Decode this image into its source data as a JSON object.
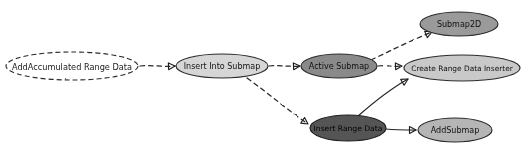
{
  "diagram": {
    "type": "call-graph",
    "style": "hand-drawn sketch",
    "background_color": "#ffffff",
    "nodes": [
      {
        "id": "add_accumulated_range_data",
        "label": "AddAccumulated Range Data",
        "cx": 72,
        "cy": 66,
        "rx": 66,
        "ry": 14,
        "fill": "#ffffff",
        "stroke": "#2b2b2b",
        "stroke_dasharray": "5,3",
        "text_color": "#1a1a1a",
        "font_size": 8.2
      },
      {
        "id": "insert_into_submap",
        "label": "Insert Into Submap",
        "cx": 222,
        "cy": 66,
        "rx": 46,
        "ry": 12,
        "fill": "#d6d6d6",
        "stroke": "#2b2b2b",
        "stroke_dasharray": "none",
        "text_color": "#141414",
        "font_size": 8.0
      },
      {
        "id": "active_submap",
        "label": "Active Submap",
        "cx": 339,
        "cy": 66,
        "rx": 38,
        "ry": 12,
        "fill": "#8a8a8a",
        "stroke": "#2b2b2b",
        "stroke_dasharray": "none",
        "text_color": "#101010",
        "font_size": 8.0
      },
      {
        "id": "submap_2d",
        "label": "Submap2D",
        "cx": 459,
        "cy": 24,
        "rx": 39,
        "ry": 12,
        "fill": "#9a9a9a",
        "stroke": "#2b2b2b",
        "stroke_dasharray": "none",
        "text_color": "#101010",
        "font_size": 8.0
      },
      {
        "id": "create_range_data_inserter",
        "label": "Create Range Data Inserter",
        "cx": 462,
        "cy": 68,
        "rx": 58,
        "ry": 13,
        "fill": "#c9c9c9",
        "stroke": "#2b2b2b",
        "stroke_dasharray": "none",
        "text_color": "#101010",
        "font_size": 7.4
      },
      {
        "id": "insert_range_data",
        "label": "Insert Range Data",
        "cx": 348,
        "cy": 128,
        "rx": 38,
        "ry": 13,
        "fill": "#555555",
        "stroke": "#1f1f1f",
        "stroke_dasharray": "none",
        "text_color": "#000000",
        "font_size": 7.6
      },
      {
        "id": "add_submap",
        "label": "AddSubmap",
        "cx": 455,
        "cy": 130,
        "rx": 37,
        "ry": 12,
        "fill": "#b5b5b5",
        "stroke": "#2b2b2b",
        "stroke_dasharray": "none",
        "text_color": "#101010",
        "font_size": 8.0
      }
    ],
    "edges": [
      {
        "id": "edge-add-accumulated-to-insert-into-submap",
        "from": "add_accumulated_range_data",
        "to": "insert_into_submap",
        "style": "dashed",
        "path": "M 140 66 C 152 65, 162 67, 175 66",
        "arrow": true
      },
      {
        "id": "edge-insert-into-submap-to-active-submap",
        "from": "insert_into_submap",
        "to": "active_submap",
        "style": "dashed",
        "path": "M 269 66 C 280 65, 289 67, 300 66",
        "arrow": true
      },
      {
        "id": "edge-insert-into-submap-to-insert-range-data",
        "from": "insert_into_submap",
        "to": "insert_range_data",
        "style": "dashed",
        "path": "M 247 78 C 272 96, 290 112, 308 124",
        "arrow": true
      },
      {
        "id": "edge-active-submap-to-submap2d",
        "from": "active_submap",
        "to": "submap_2d",
        "style": "dashed",
        "path": "M 371 60 C 392 50, 412 40, 432 32",
        "arrow": true
      },
      {
        "id": "edge-active-submap-to-create-range-data-inserter",
        "from": "active_submap",
        "to": "create_range_data_inserter",
        "style": "dashed",
        "path": "M 378 66 C 386 65, 394 67, 402 66",
        "arrow": true
      },
      {
        "id": "edge-insert-range-data-to-create-range-data-inserter",
        "from": "insert_range_data",
        "to": "create_range_data_inserter",
        "style": "solid",
        "path": "M 358 116 C 374 102, 392 88, 408 79",
        "arrow": true
      },
      {
        "id": "edge-insert-range-data-to-add-submap",
        "from": "insert_range_data",
        "to": "add_submap",
        "style": "solid",
        "path": "M 386 129 C 395 130, 404 130, 416 130",
        "arrow": true
      }
    ]
  }
}
